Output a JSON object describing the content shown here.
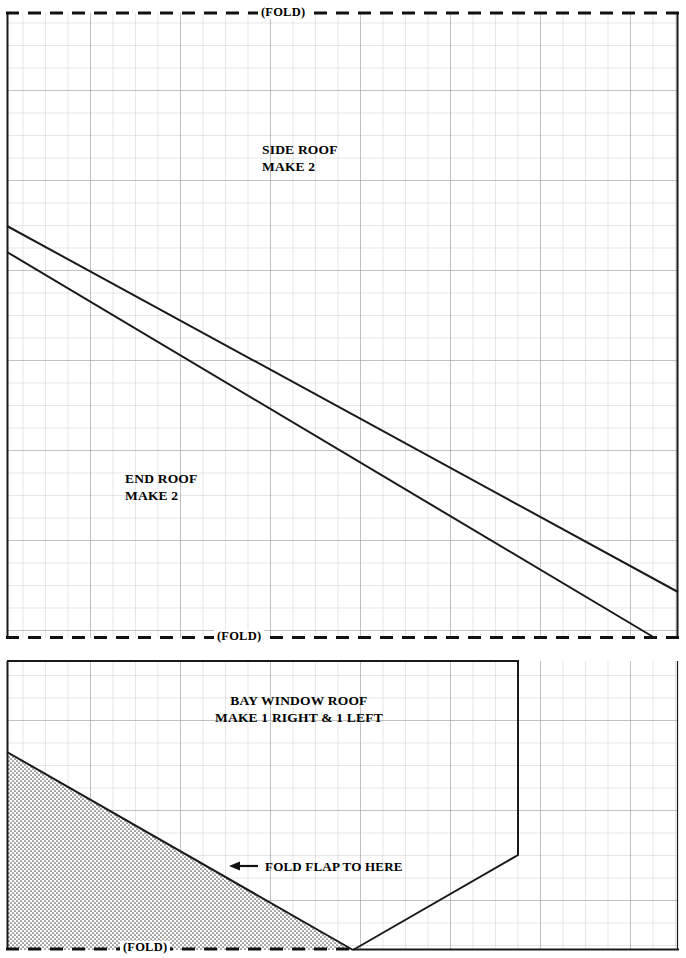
{
  "document": {
    "type": "cut-and-fold paper model pattern sheet",
    "background_color": "#ffffff",
    "grid_color": "#b9b9b9",
    "grid_major_color": "#9a9a9a",
    "outline_color": "#1a1a1a",
    "shade_color": "#6f6f6f",
    "width": 686,
    "height": 958
  },
  "top_panel": {
    "fold_top_label": "(FOLD)",
    "fold_bottom_label": "(FOLD)",
    "parts": [
      {
        "name": "side-roof",
        "line1": "SIDE ROOF",
        "line2": "MAKE 2"
      },
      {
        "name": "end-roof",
        "line1": "END ROOF",
        "line2": "MAKE 2"
      }
    ]
  },
  "bottom_panel": {
    "fold_bottom_label": "(FOLD)",
    "part": {
      "name": "bay-window-roof",
      "line1": "BAY WINDOW ROOF",
      "line2": "MAKE 1 RIGHT & 1 LEFT"
    },
    "annotation": {
      "arrow": "←",
      "text": "FOLD FLAP TO HERE"
    }
  },
  "geometry": {
    "grid_cell_px": 22.5,
    "grid_major_every": 4,
    "top_panel_box": {
      "left": 7,
      "top": 13,
      "right": 678,
      "bottom": 638
    },
    "bottom_panel_box": {
      "left": 7,
      "top": 661,
      "right": 678,
      "bottom": 950
    },
    "side_roof_diagonal": {
      "x1": 7,
      "y1": 226,
      "x2": 678,
      "y2": 592
    },
    "end_roof_diagonal": {
      "x1": 7,
      "y1": 252,
      "x2": 655,
      "y2": 638
    },
    "bay_outline": [
      [
        7,
        661
      ],
      [
        518,
        661
      ],
      [
        518,
        855
      ],
      [
        353,
        950
      ],
      [
        7,
        950
      ]
    ],
    "bay_flap_triangle": [
      [
        7,
        752
      ],
      [
        353,
        950
      ],
      [
        7,
        950
      ]
    ]
  }
}
